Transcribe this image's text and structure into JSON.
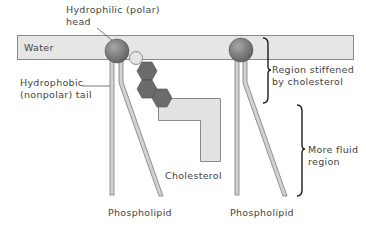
{
  "labels": {
    "head_line1": "Hydrophilic (polar)",
    "head_line2": "head",
    "water": "Water",
    "tail_line1": "Hydrophobic",
    "tail_line2": "(nonpolar) tail",
    "stiff_line1": "Region stiffened",
    "stiff_line2": "by cholesterol",
    "fluid_line1": "More fluid",
    "fluid_line2": "region",
    "cholesterol": "Cholesterol",
    "phospholipid_left": "Phospholipid",
    "phospholipid_right": "Phospholipid"
  },
  "colors": {
    "water_band": "#e6e6e6",
    "water_border": "#8a8a8a",
    "head": "#7a7a7a",
    "tail_fill": "#d2d2d2",
    "tail_border": "#7a7a7a",
    "hexagon": "#6b6b6b",
    "cholesterol_circle": "#e4e4e4",
    "cholesterol_body": "#e2e2e2",
    "brace": "#1a1a1a"
  }
}
